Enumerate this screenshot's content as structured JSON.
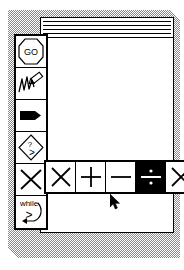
{
  "app": {
    "window_title": "",
    "background_style": "dithered-gray-desktop",
    "accent_color": "#000000",
    "surface_color": "#ffffff",
    "desktop_color": "#8a8a8a"
  },
  "titlebar": {
    "stripe_count": 4,
    "has_close_box": false
  },
  "palette": {
    "orientation": "vertical",
    "items": [
      {
        "name": "go-button",
        "icon": "octagon-go-icon",
        "label": "GO",
        "selected": false
      },
      {
        "name": "draw-button",
        "icon": "scribble-pencil-icon",
        "label": "",
        "selected": false
      },
      {
        "name": "pointer-tag-button",
        "icon": "black-tag-arrow-icon",
        "label": "",
        "selected": false
      },
      {
        "name": "conditional-button",
        "icon": "diamond-question-icon",
        "label": "?>",
        "selected": false
      },
      {
        "name": "delete-button",
        "icon": "x-cross-icon",
        "label": "",
        "selected": false
      },
      {
        "name": "while-loop-button",
        "icon": "while-loop-icon",
        "label": "while",
        "selected": false
      }
    ]
  },
  "operator_toolbar": {
    "orientation": "horizontal",
    "items": [
      {
        "name": "op-cross-button",
        "icon": "x-cross-icon",
        "label": "X",
        "selected": false
      },
      {
        "name": "op-plus-button",
        "icon": "plus-icon",
        "label": "+",
        "selected": false
      },
      {
        "name": "op-minus-button",
        "icon": "minus-icon",
        "label": "−",
        "selected": false
      },
      {
        "name": "op-divide-button",
        "icon": "divide-icon",
        "label": "÷",
        "selected": true
      },
      {
        "name": "op-multiply-button",
        "icon": "multiply-icon",
        "label": "×",
        "selected": false
      }
    ],
    "selected_index": 3
  },
  "pointer": {
    "name": "mouse-cursor",
    "x": 110,
    "y": 194
  }
}
